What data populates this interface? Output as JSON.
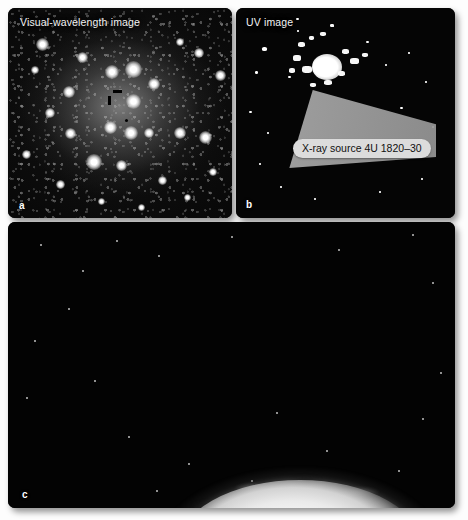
{
  "figure": {
    "panels": [
      {
        "id": "a",
        "letter": "a",
        "label": "Visual-wavelength image",
        "description": "Dense globular star cluster imaged at visual wavelengths, with black tick marks indicating the position of the X-ray source",
        "markers": [
          "vertical-tick",
          "horizontal-tick",
          "small-dot"
        ]
      },
      {
        "id": "b",
        "letter": "b",
        "label": "UV image",
        "description": "Same cluster core imaged in the ultraviolet; a single bright source dominates",
        "callout": "X-ray source 4U 1820–30",
        "callout_color": "#dcdcdc",
        "wedge_color": "#a8a8a8"
      },
      {
        "id": "c",
        "letter": "c",
        "label": "",
        "description": "Artist's impression of the binary: a bright teardrop-shaped donor star at lower left feeding a stream of gas through a hot spot into a large luminous accretion disk with a compact object at its centre",
        "features": [
          "donor-star",
          "gas-stream",
          "hot-spot",
          "accretion-disk",
          "disk-rim",
          "compact-object"
        ]
      }
    ]
  }
}
